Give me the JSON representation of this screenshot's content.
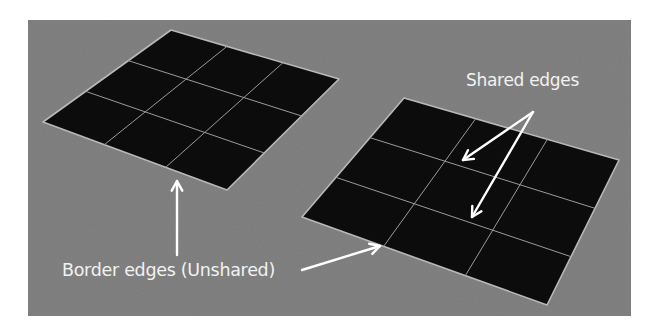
{
  "diagram": {
    "background_color": "#7a7a7a",
    "panel": {
      "x": 28,
      "y": 20,
      "width": 603,
      "height": 296
    },
    "mesh_fill_color": "#0c0c0c",
    "edge_color": "#b8b8b8",
    "arrow_color": "#ffffff",
    "grids": [
      {
        "name": "left-plane",
        "divisions": 3,
        "corners": {
          "top": [
            171,
            30
          ],
          "right": [
            339,
            79
          ],
          "bottom": [
            227,
            190
          ],
          "left": [
            43,
            122
          ]
        }
      },
      {
        "name": "right-plane",
        "divisions": 3,
        "corners": {
          "top": [
            404,
            98
          ],
          "right": [
            619,
            160
          ],
          "bottom": [
            547,
            305
          ],
          "left": [
            302,
            217
          ]
        }
      }
    ],
    "labels": {
      "shared": "Shared edges",
      "border": "Border edges (Unshared)"
    },
    "arrows": [
      {
        "name": "shared-arrow-1",
        "from": [
          533,
          112
        ],
        "to": [
          463,
          160
        ]
      },
      {
        "name": "shared-arrow-2",
        "from": [
          533,
          112
        ],
        "to": [
          472,
          217
        ]
      },
      {
        "name": "border-arrow-up",
        "from": [
          177,
          255
        ],
        "to": [
          177,
          181
        ]
      },
      {
        "name": "border-arrow-right",
        "from": [
          302,
          270
        ],
        "to": [
          380,
          246
        ]
      }
    ]
  }
}
